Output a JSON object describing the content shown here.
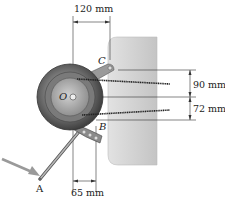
{
  "figure": {
    "dimensions": {
      "horizontal_top": "120 mm",
      "vertical_upper": "90 mm",
      "vertical_lower": "72 mm",
      "horizontal_bottom": "65 mm"
    },
    "points": {
      "O": "O",
      "A": "A",
      "B": "B",
      "C": "C"
    },
    "colors": {
      "plate": "#d4d4d4",
      "wheel_dark": "#555555",
      "wheel_light": "#a8a8a8",
      "force_arrow": "#9a9a9a",
      "line": "#222222"
    }
  }
}
